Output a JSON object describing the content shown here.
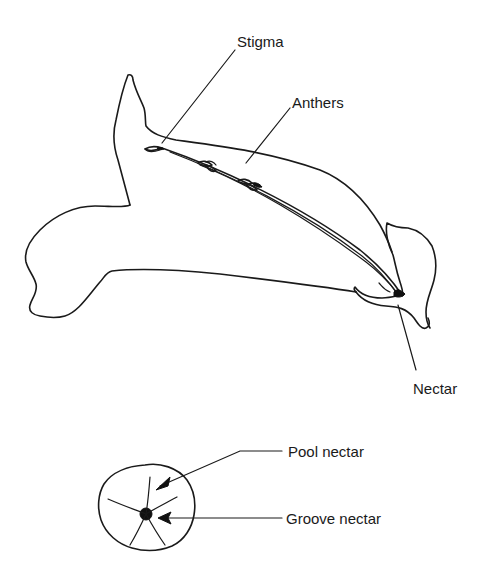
{
  "diagram": {
    "type": "botanical-illustration",
    "labels": {
      "stigma": "Stigma",
      "anthers": "Anthers",
      "nectar": "Nectar",
      "pool_nectar": "Pool nectar",
      "groove_nectar": "Groove nectar"
    },
    "colors": {
      "line": "#1a1a1a",
      "background": "#ffffff"
    }
  }
}
